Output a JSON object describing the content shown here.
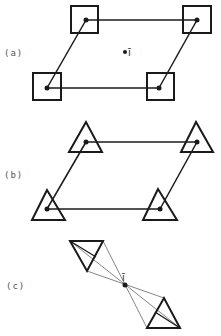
{
  "figure": {
    "panels": [
      {
        "label": "(a)",
        "motif": "square",
        "center_label": "ī"
      },
      {
        "label": "(b)",
        "motif": "triangle"
      },
      {
        "label": "(c)",
        "motif": "triangle-pair",
        "center_label": "ī"
      }
    ],
    "colors": {
      "ink": "#1a1a1a",
      "thin": "#555555",
      "background": "#ffffff"
    }
  }
}
